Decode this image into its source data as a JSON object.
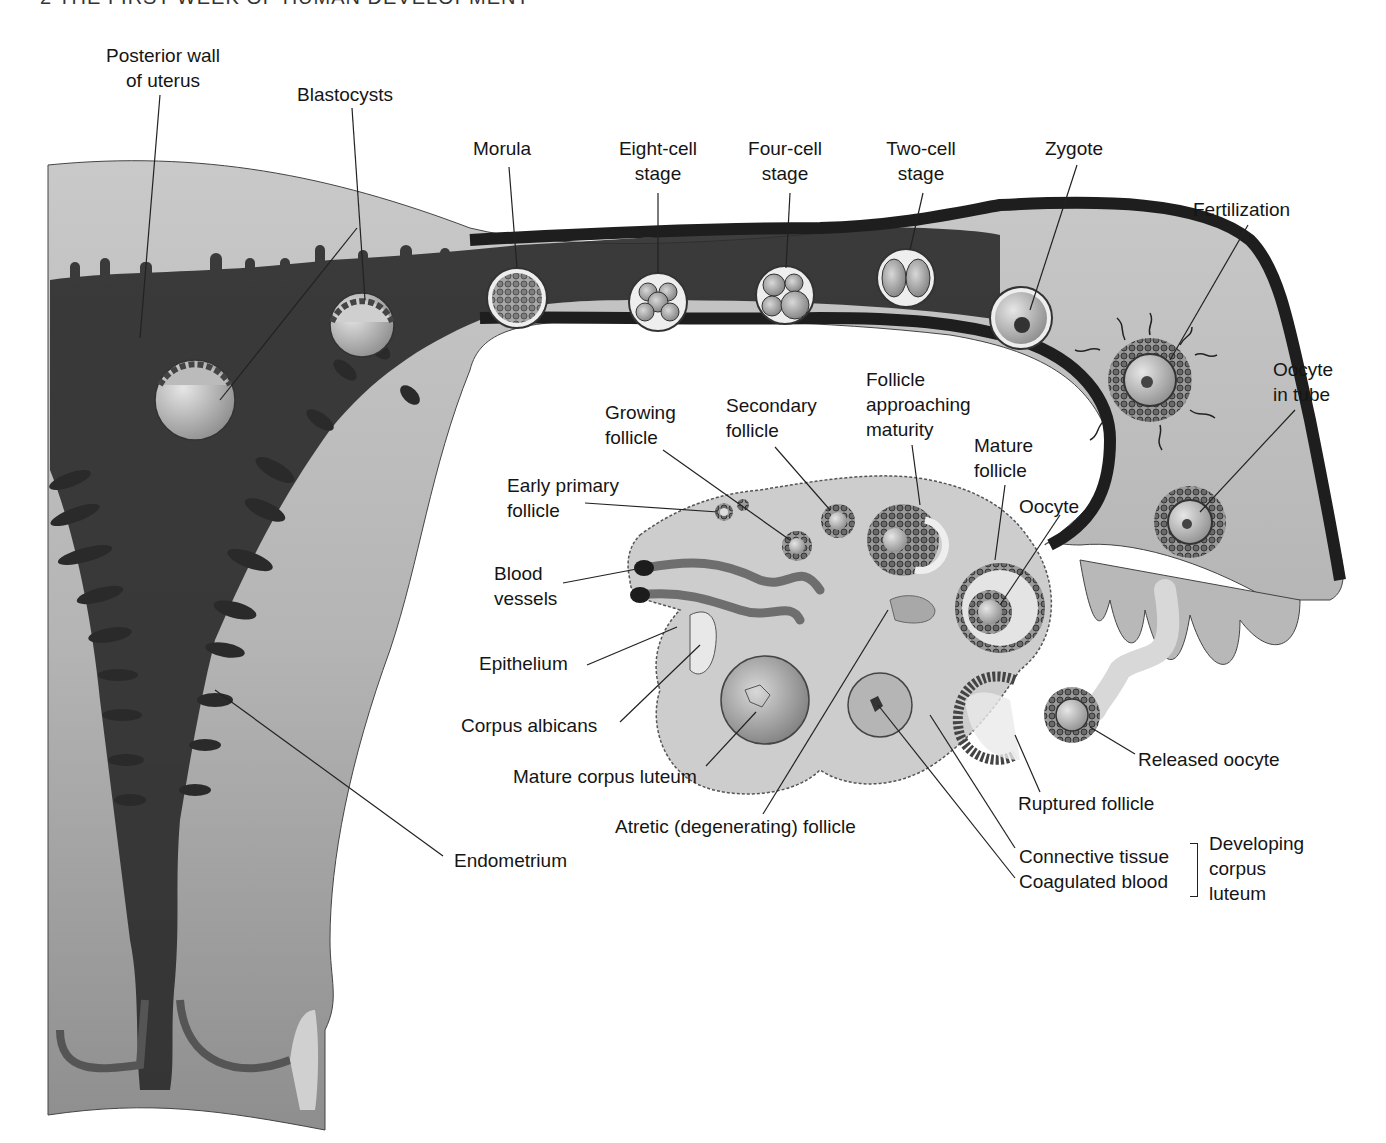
{
  "header": {
    "running_head": "2   THE FIRST WEEK OF HUMAN DEVELOPMENT"
  },
  "figure": {
    "colors": {
      "uterus_light": "#bdbdbd",
      "uterus_dark": "#2a2a2a",
      "tube_wall": "#1e1e1e",
      "ovary_fill": "#cfcfcf",
      "background": "#ffffff"
    }
  },
  "labels": {
    "posterior_wall": [
      "Posterior wall",
      "of uterus"
    ],
    "blastocysts": "Blastocysts",
    "morula": "Morula",
    "eight_cell": [
      "Eight-cell",
      "stage"
    ],
    "four_cell": [
      "Four-cell",
      "stage"
    ],
    "two_cell": [
      "Two-cell",
      "stage"
    ],
    "zygote": "Zygote",
    "fertilization": "Fertilization",
    "oocyte_in_tube": [
      "Oocyte",
      "in tube"
    ],
    "growing_follicle": [
      "Growing",
      "follicle"
    ],
    "secondary_follicle": [
      "Secondary",
      "follicle"
    ],
    "follicle_approaching": [
      "Follicle",
      "approaching",
      "maturity"
    ],
    "mature_follicle": [
      "Mature",
      "follicle"
    ],
    "oocyte": "Oocyte",
    "early_primary": [
      "Early primary",
      "follicle"
    ],
    "blood_vessels": [
      "Blood",
      "vessels"
    ],
    "epithelium": "Epithelium",
    "corpus_albicans": "Corpus albicans",
    "mature_corpus_luteum": "Mature corpus luteum",
    "atretic_follicle": "Atretic (degenerating) follicle",
    "endometrium": "Endometrium",
    "released_oocyte": "Released oocyte",
    "ruptured_follicle": "Ruptured follicle",
    "connective_tissue": "Connective tissue",
    "coagulated_blood": "Coagulated blood",
    "developing_corpus_luteum": [
      "Developing",
      "corpus",
      "luteum"
    ]
  }
}
